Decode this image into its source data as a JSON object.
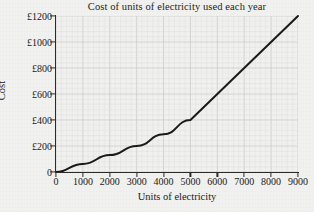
{
  "chart_data": {
    "type": "line",
    "title": "Cost of units of electricity used each year",
    "xlabel": "Units of electricity",
    "ylabel": "Cost",
    "xlim": [
      0,
      9000
    ],
    "ylim": [
      0,
      1200
    ],
    "grid": true,
    "legend": null,
    "x_tick_labels": [
      "0",
      "1000",
      "2000",
      "3000",
      "4000",
      "5000",
      "6000",
      "7000",
      "8000",
      "9000"
    ],
    "x_ticks": [
      0,
      1000,
      2000,
      3000,
      4000,
      5000,
      6000,
      7000,
      8000,
      9000
    ],
    "y_tick_labels": [
      "0",
      "£200",
      "£400",
      "£600",
      "£800",
      "£1000",
      "£1200"
    ],
    "y_ticks": [
      0,
      200,
      400,
      600,
      800,
      1000,
      1200
    ],
    "currency_symbol": "£",
    "series": [
      {
        "name": "Cost of electricity",
        "color": "#1a1a1a",
        "x": [
          0,
          1000,
          2000,
          3000,
          4000,
          5000,
          6000,
          7000,
          8000,
          9000
        ],
        "values": [
          0,
          62,
          130,
          200,
          290,
          400,
          600,
          800,
          1000,
          1200
        ]
      }
    ],
    "annotations": [
      {
        "label": "kink",
        "x": 5000,
        "y": 400
      }
    ]
  },
  "colors": {
    "background": "#f1f1ef",
    "axis": "#2a2a2a",
    "line": "#1a1a1a",
    "grid_major": "#c9c9c9",
    "grid_minor": "#e0e0de",
    "text": "#1a1a1a"
  }
}
